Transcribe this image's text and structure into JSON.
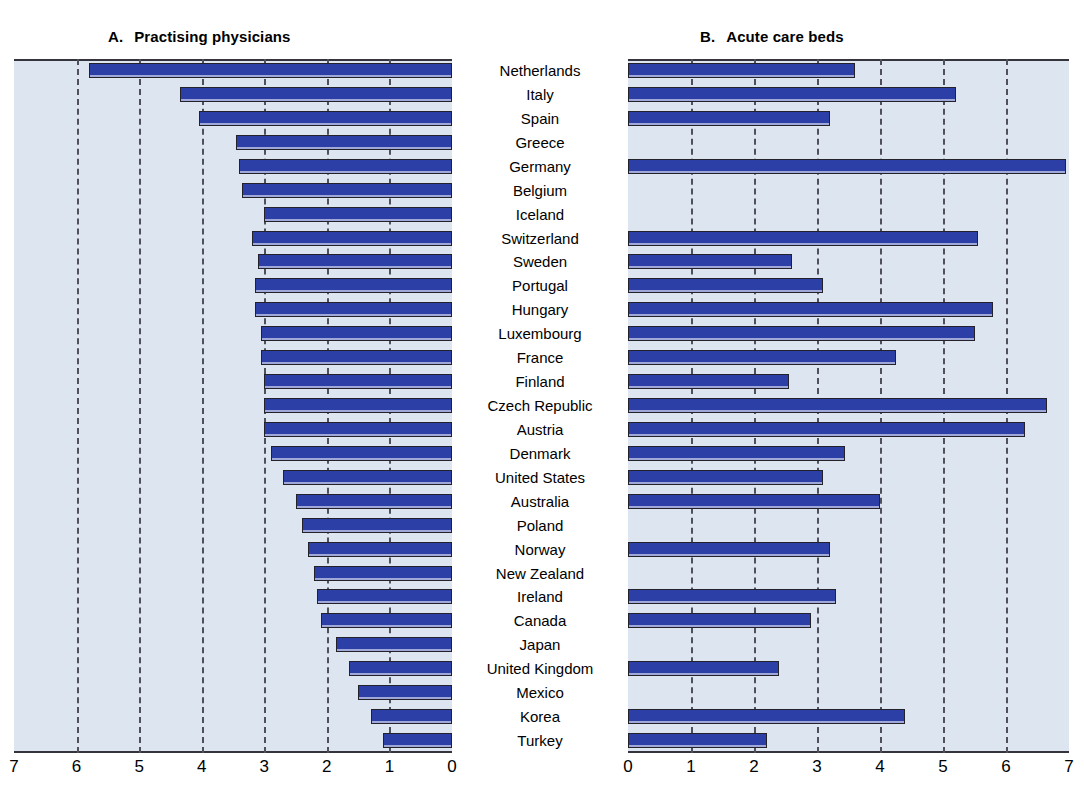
{
  "panels": {
    "a": {
      "letter": "A.",
      "title": "Practising physicians"
    },
    "b": {
      "letter": "B.",
      "title": "Acute care beds"
    }
  },
  "axis_a": {
    "ticks": [
      "7",
      "6",
      "5",
      "4",
      "3",
      "2",
      "1",
      "0"
    ],
    "min": 0,
    "max": 7,
    "reversed": true
  },
  "axis_b": {
    "ticks": [
      "0",
      "1",
      "2",
      "3",
      "4",
      "5",
      "6",
      "7"
    ],
    "min": 0,
    "max": 7,
    "reversed": false
  },
  "chart_data": {
    "type": "bar",
    "title": "",
    "orientation": "horizontal",
    "layout": "two-panel mirrored population pyramid style; shared centred country label column",
    "grid": true,
    "legend": null,
    "categories": [
      "Netherlands",
      "Italy",
      "Spain",
      "Greece",
      "Germany",
      "Belgium",
      "Iceland",
      "Switzerland",
      "Sweden",
      "Portugal",
      "Hungary",
      "Luxembourg",
      "France",
      "Finland",
      "Czech Republic",
      "Austria",
      "Denmark",
      "United States",
      "Australia",
      "Poland",
      "Norway",
      "New Zealand",
      "Ireland",
      "Canada",
      "Japan",
      "United Kingdom",
      "Mexico",
      "Korea",
      "Turkey"
    ],
    "series": [
      {
        "name": "A. Practising physicians",
        "panel": "a",
        "direction": "right-to-left",
        "xlabel": "",
        "ylabel": "",
        "xlim": [
          7,
          0
        ],
        "values": [
          5.8,
          4.35,
          4.05,
          3.45,
          3.4,
          3.35,
          3.0,
          3.2,
          3.1,
          3.15,
          3.15,
          3.05,
          3.05,
          3.0,
          3.0,
          3.0,
          2.9,
          2.7,
          2.5,
          2.4,
          2.3,
          2.2,
          2.15,
          2.1,
          1.85,
          1.65,
          1.5,
          1.3,
          1.1
        ]
      },
      {
        "name": "B. Acute care beds",
        "panel": "b",
        "direction": "left-to-right",
        "xlabel": "",
        "ylabel": "",
        "xlim": [
          0,
          7
        ],
        "values": [
          3.6,
          5.2,
          3.2,
          null,
          6.95,
          null,
          null,
          5.55,
          2.6,
          3.1,
          5.8,
          5.5,
          4.25,
          2.55,
          6.65,
          6.3,
          3.45,
          3.1,
          4.0,
          null,
          3.2,
          null,
          3.3,
          2.9,
          null,
          2.4,
          null,
          4.4,
          2.2
        ]
      }
    ]
  },
  "colors": {
    "bar_fill": "#2c3fa7",
    "bar_border": "#23222a",
    "plot_background": "#dde5f1",
    "gridline": "#50505a",
    "axis_line": "#35343c",
    "page_background": "#ffffff"
  }
}
